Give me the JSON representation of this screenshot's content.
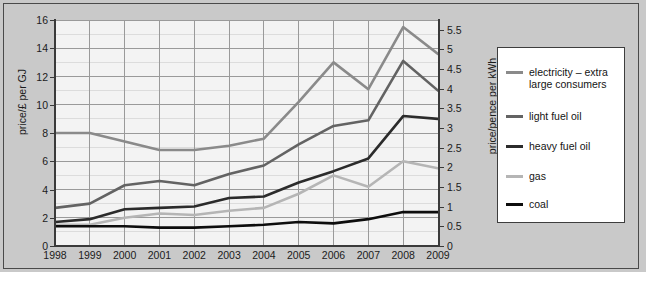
{
  "chart_data": {
    "type": "line",
    "title": "",
    "xlabel": "year",
    "ylabel": "price/£ per GJ",
    "ylabel_right": "price/pence per kWh",
    "grid": true,
    "legend_position": "right-outside",
    "x": [
      1998,
      1999,
      2000,
      2001,
      2002,
      2003,
      2004,
      2005,
      2006,
      2007,
      2008,
      2009
    ],
    "categories": [
      "1998",
      "1999",
      "2000",
      "2001",
      "2002",
      "2003",
      "2004",
      "2005",
      "2006",
      "2007",
      "2008",
      "2009"
    ],
    "ylim": [
      0,
      16
    ],
    "yticks": [
      0,
      2,
      4,
      6,
      8,
      10,
      12,
      14,
      16
    ],
    "ylim_right": [
      0,
      5.75
    ],
    "yticks_right": [
      0,
      0.5,
      1,
      1.5,
      2,
      2.5,
      3,
      3.5,
      4,
      4.5,
      5,
      5.5
    ],
    "series": [
      {
        "name": "electricity – extra large consumers",
        "color": "#8a8a8a",
        "values": [
          8.0,
          8.0,
          7.4,
          6.8,
          6.8,
          7.1,
          7.6,
          10.2,
          13.0,
          11.1,
          15.5,
          13.6
        ]
      },
      {
        "name": "light fuel oil",
        "color": "#636363",
        "values": [
          2.7,
          3.0,
          4.3,
          4.6,
          4.3,
          5.1,
          5.7,
          7.2,
          8.5,
          8.9,
          13.1,
          11.0
        ]
      },
      {
        "name": "heavy fuel oil",
        "color": "#2b2b2b",
        "values": [
          1.7,
          1.9,
          2.6,
          2.7,
          2.8,
          3.4,
          3.5,
          4.5,
          5.3,
          6.2,
          9.2,
          9.0
        ]
      },
      {
        "name": "gas",
        "color": "#b5b5b5",
        "values": [
          1.5,
          1.5,
          2.0,
          2.3,
          2.2,
          2.5,
          2.7,
          3.7,
          5.0,
          4.2,
          6.0,
          5.5
        ]
      },
      {
        "name": "coal",
        "color": "#0d0d0d",
        "values": [
          1.4,
          1.4,
          1.4,
          1.3,
          1.3,
          1.4,
          1.5,
          1.7,
          1.6,
          1.9,
          2.4,
          2.4
        ]
      }
    ]
  },
  "axes": {
    "left": {
      "title": "price/£ per GJ",
      "ticks": [
        "0",
        "2",
        "4",
        "6",
        "8",
        "10",
        "12",
        "14",
        "16"
      ]
    },
    "right": {
      "title": "price/pence per kWh",
      "ticks": [
        "0",
        "0.5",
        "1",
        "1.5",
        "2",
        "2.5",
        "3",
        "3.5",
        "4",
        "4.5",
        "5",
        "5.5"
      ]
    },
    "bottom": {
      "title": "year",
      "ticks": [
        "1998",
        "1999",
        "2000",
        "2001",
        "2002",
        "2003",
        "2004",
        "2005",
        "2006",
        "2007",
        "2008",
        "2009"
      ]
    }
  },
  "legend": {
    "items": [
      {
        "label": "electricity – extra large consumers",
        "color": "#8a8a8a"
      },
      {
        "label": "light fuel oil",
        "color": "#636363"
      },
      {
        "label": "heavy fuel oil",
        "color": "#2b2b2b"
      },
      {
        "label": "gas",
        "color": "#b5b5b5"
      },
      {
        "label": "coal",
        "color": "#0d0d0d"
      }
    ]
  },
  "caption": {
    "text": ""
  }
}
